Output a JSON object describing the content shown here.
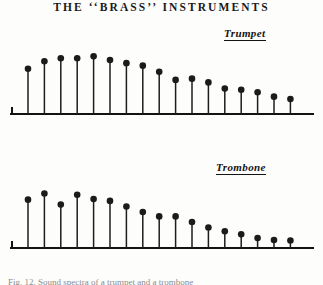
{
  "figure": {
    "title": "THE ‘‘BRASS’’ INSTRUMENTS",
    "caption": "Fig. 12.  Sound spectra of a trumpet and a trombone",
    "ink_color": "#1b1b1b",
    "paper_color": "#fdfdfc"
  },
  "panels": [
    {
      "id": "trumpet",
      "label": "Trumpet"
    },
    {
      "id": "trombone",
      "label": "Trombone"
    }
  ],
  "chart_data": [
    {
      "type": "bar",
      "title": "Trumpet",
      "subtitle": "THE ‘‘BRASS’’ INSTRUMENTS",
      "xlabel": "",
      "ylabel": "",
      "categories": [
        "1",
        "2",
        "3",
        "4",
        "5",
        "6",
        "7",
        "8",
        "9",
        "10",
        "11",
        "12",
        "13",
        "14",
        "15",
        "16",
        "17"
      ],
      "x": [
        1,
        2,
        3,
        4,
        5,
        6,
        7,
        8,
        9,
        10,
        11,
        12,
        13,
        14,
        15,
        16,
        17
      ],
      "values": [
        73,
        85,
        90,
        90,
        93,
        87,
        82,
        78,
        68,
        55,
        57,
        51,
        41,
        39,
        35,
        28,
        24
      ],
      "ylim": [
        0,
        100
      ],
      "grid": false,
      "legend": "none",
      "marker": "filled-circle",
      "notes": "Relative amplitude of successive harmonic partials"
    },
    {
      "type": "bar",
      "title": "Trombone",
      "subtitle": "",
      "xlabel": "",
      "ylabel": "",
      "categories": [
        "1",
        "2",
        "3",
        "4",
        "5",
        "6",
        "7",
        "8",
        "9",
        "10",
        "11",
        "12",
        "13",
        "14",
        "15",
        "16",
        "17"
      ],
      "x": [
        1,
        2,
        3,
        4,
        5,
        6,
        7,
        8,
        9,
        10,
        11,
        12,
        13,
        14,
        15,
        16,
        17
      ],
      "values": [
        78,
        88,
        70,
        86,
        79,
        76,
        67,
        58,
        51,
        51,
        42,
        33,
        27,
        22,
        16,
        13,
        12
      ],
      "ylim": [
        0,
        100
      ],
      "grid": false,
      "legend": "none",
      "marker": "filled-circle",
      "notes": "Relative amplitude of successive harmonic partials"
    }
  ]
}
